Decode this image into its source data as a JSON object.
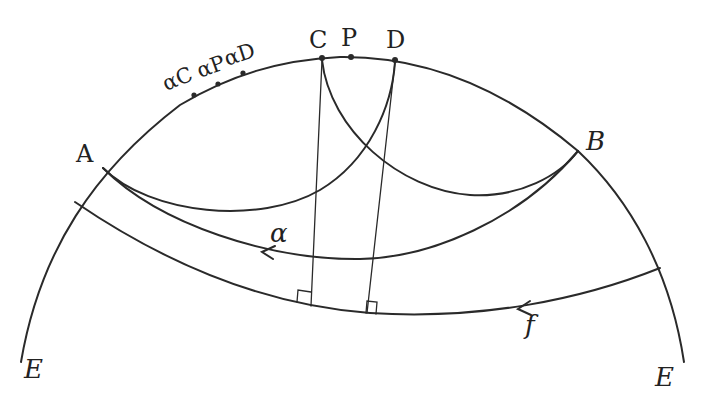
{
  "diagram": {
    "title": "",
    "type": "hyperbolic-geometry-construction",
    "colors": {
      "ink": "#2a2a2a",
      "background": "#ffffff"
    },
    "labels": {
      "A": "A",
      "B": "B",
      "C": "C",
      "P": "P",
      "D": "D",
      "alphaC": "αC",
      "alphaP": "αP",
      "alphaD": "αD",
      "alpha": "α",
      "f": "f",
      "E_left": "E",
      "E_right": "E"
    },
    "points": [
      {
        "name": "A",
        "x": 103,
        "y": 168
      },
      {
        "name": "B",
        "x": 578,
        "y": 151
      },
      {
        "name": "C",
        "x": 322,
        "y": 58
      },
      {
        "name": "P",
        "x": 350,
        "y": 57
      },
      {
        "name": "D",
        "x": 395,
        "y": 60
      },
      {
        "name": "αC",
        "x": 194,
        "y": 95
      },
      {
        "name": "αP",
        "x": 218,
        "y": 84
      },
      {
        "name": "αD",
        "x": 243,
        "y": 73
      }
    ],
    "curves": [
      {
        "name": "boundary-circle-E",
        "description": "outer boundary arc labelled E on both sides"
      },
      {
        "name": "arc-A-to-D",
        "description": "arc from A down and up to D"
      },
      {
        "name": "arc-C-to-B",
        "description": "arc from C down and up to B"
      },
      {
        "name": "line-alpha",
        "description": "line α from B to A with arrow pointing left"
      },
      {
        "name": "line-f",
        "description": "line f with arrow pointing left"
      },
      {
        "name": "perpendicular-from-C",
        "description": "segment from C perpendicular to f"
      },
      {
        "name": "perpendicular-from-D",
        "description": "segment from D perpendicular to f"
      }
    ]
  }
}
